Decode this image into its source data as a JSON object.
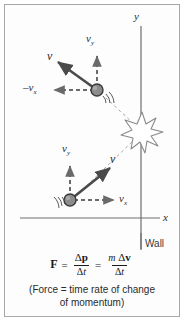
{
  "figure": {
    "background_color": "#fdfdfd",
    "border_color": "#a8a8a8"
  },
  "axes": {
    "y_label": "y",
    "x_label": "x",
    "color": "#6e6e6e"
  },
  "wall": {
    "label": "Wall"
  },
  "incoming_ball": {
    "name": "incoming-ball",
    "velocity_label": "v",
    "vy_label": "v",
    "vy_subscript": "y",
    "vx_label": "v",
    "vx_subscript": "x",
    "ball_fill": "#8c8c8c",
    "ball_stroke": "#3a3a3a"
  },
  "rebounding_ball": {
    "name": "rebounding-ball",
    "velocity_label": "v",
    "vy_label": "v",
    "vy_subscript": "y",
    "vx_label": "–v",
    "vx_subscript": "x",
    "ball_fill": "#8c8c8c",
    "ball_stroke": "#3a3a3a"
  },
  "collision": {
    "name": "collision-starburst",
    "stroke": "#8a8a8a"
  },
  "equation": {
    "force_symbol": "F",
    "equals_1": "=",
    "equals_2": "=",
    "numerator_1_delta": "Δ",
    "numerator_1_vector": "p",
    "denominator_1_delta": "Δ",
    "denominator_1_var": "t",
    "numerator_2_mass": "m",
    "numerator_2_delta": "Δ",
    "numerator_2_vector": "v",
    "denominator_2_delta": "Δ",
    "denominator_2_var": "t"
  },
  "caption": {
    "line1": "(Force = time rate of change",
    "line2": "of momentum)"
  }
}
